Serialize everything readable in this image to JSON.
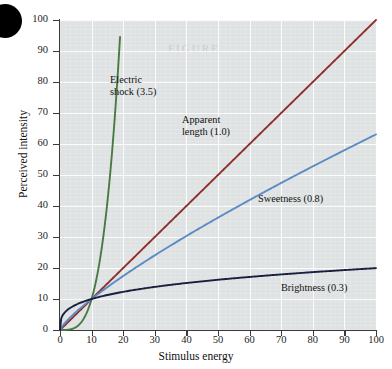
{
  "figure": {
    "watermark_text": "FIGURE"
  },
  "chart_data": {
    "type": "line",
    "title": "",
    "xlabel": "Stimulus energy",
    "ylabel": "Perceived intensity",
    "xlim": [
      0,
      100
    ],
    "ylim": [
      0,
      100
    ],
    "xticks": [
      0,
      10,
      20,
      30,
      40,
      50,
      60,
      70,
      80,
      90,
      100
    ],
    "yticks": [
      0,
      10,
      20,
      30,
      40,
      50,
      60,
      70,
      80,
      90,
      100
    ],
    "xtick_labels": [
      "0",
      "10",
      "20",
      "30",
      "40",
      "50",
      "60",
      "70",
      "80",
      "90",
      "100"
    ],
    "ytick_labels": [
      "0",
      "10",
      "20",
      "30",
      "40",
      "50",
      "60",
      "70",
      "80",
      "90",
      "100"
    ],
    "grid": true,
    "legend_position": "inline-annotations",
    "note": "Stevens power law: y = 10 * (x/10)^n ; all curves pass through (10,10)",
    "series": [
      {
        "name": "Electric shock (3.5)",
        "exponent": 3.5,
        "color": "#4a7a44",
        "label": "Electric\nshock (3.5)",
        "x": [
          0,
          1,
          2,
          3,
          4,
          5,
          6,
          7,
          8,
          9,
          10,
          11,
          12,
          13,
          14,
          15,
          16,
          17,
          18,
          19
        ],
        "values": [
          0,
          0.003,
          0.035,
          0.146,
          0.4,
          0.88,
          1.67,
          2.88,
          4.58,
          6.84,
          10,
          13.9,
          18.9,
          25.1,
          32.6,
          41.4,
          51.9,
          64,
          77.9,
          93.7
        ]
      },
      {
        "name": "Apparent length (1.0)",
        "exponent": 1.0,
        "color": "#8f2e2a",
        "label": "Apparent\nlength (1.0)",
        "x": [
          0,
          10,
          20,
          30,
          40,
          50,
          60,
          70,
          80,
          90,
          100
        ],
        "values": [
          0,
          10,
          20,
          30,
          40,
          50,
          60,
          70,
          80,
          90,
          100
        ]
      },
      {
        "name": "Sweetness (0.8)",
        "exponent": 0.8,
        "color": "#5b8cc4",
        "label": "Sweetness (0.8)",
        "x": [
          0,
          10,
          20,
          30,
          40,
          50,
          60,
          70,
          80,
          90,
          100
        ],
        "values": [
          0,
          10,
          17.4,
          24.1,
          30.3,
          36.2,
          41.9,
          47.4,
          52.8,
          58,
          63.1
        ]
      },
      {
        "name": "Brightness (0.3)",
        "exponent": 0.3,
        "color": "#1a1f3d",
        "label": "Brightness (0.3)",
        "x": [
          0,
          10,
          20,
          30,
          40,
          50,
          60,
          70,
          80,
          90,
          100
        ],
        "values": [
          0,
          10,
          12.3,
          13.9,
          15.2,
          16.2,
          17.1,
          17.8,
          18.5,
          19.1,
          19.95
        ]
      }
    ]
  }
}
